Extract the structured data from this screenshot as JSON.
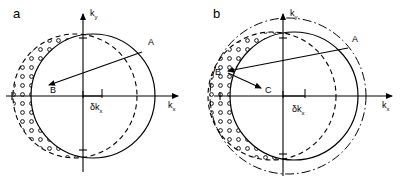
{
  "figure": {
    "type": "scientific-diagram",
    "background_color": "#ffffff",
    "line_color": "#000000",
    "width": 400,
    "height": 183
  },
  "panels": [
    {
      "id": "a",
      "label": "a",
      "label_pos": {
        "x": 13,
        "y": 18
      },
      "axes": {
        "x_label": "k",
        "x_subscript": "x",
        "y_label": "k",
        "y_subscript": "y",
        "origin": {
          "x": 83,
          "y": 96
        },
        "x_axis_from": 6,
        "x_axis_to": 178,
        "y_axis_from": 172,
        "y_axis_to": 14,
        "x_label_pos": {
          "x": 168,
          "y": 108
        },
        "y_label_pos": {
          "x": 90,
          "y": 16
        }
      },
      "circles": [
        {
          "name": "solid-fermi-sphere-displaced",
          "style": "solid",
          "cx": 93,
          "cy": 96,
          "r": 62
        },
        {
          "name": "dashed-fermi-sphere-equilibrium",
          "style": "dashed",
          "cx": 75,
          "cy": 96,
          "r": 62
        }
      ],
      "regions": [
        {
          "name": "filled-dots-region",
          "marker": "filled-circle",
          "side": "right",
          "description": "occupied states crescent (filled dots)"
        },
        {
          "name": "open-dots-region",
          "marker": "open-circle",
          "side": "left",
          "description": "emptied states crescent (open circles)"
        }
      ],
      "annotations": [
        {
          "name": "point-label-A",
          "text": "A",
          "x": 148,
          "y": 45
        },
        {
          "name": "point-label-B",
          "text": "B",
          "x": 50,
          "y": 93
        },
        {
          "name": "delta-kx-label",
          "text": "δk",
          "subscript": "x",
          "x": 90,
          "y": 110
        }
      ],
      "arrow": {
        "name": "scattering-arrow-A-to-B",
        "from": {
          "x": 142,
          "y": 52
        },
        "to": {
          "x": 49,
          "y": 85
        }
      },
      "delta_marker": {
        "name": "delta-kx-extent",
        "from_x": 83,
        "to_x": 102,
        "y": 96
      }
    },
    {
      "id": "b",
      "label": "b",
      "label_pos": {
        "x": 213,
        "y": 18
      },
      "axes": {
        "x_label": "k",
        "x_subscript": "x",
        "y_label": "k",
        "y_subscript": "y",
        "origin": {
          "x": 283,
          "y": 96
        },
        "x_axis_from": 214,
        "x_axis_to": 392,
        "y_axis_from": 176,
        "y_axis_to": 14,
        "x_label_pos": {
          "x": 382,
          "y": 108
        },
        "y_label_pos": {
          "x": 290,
          "y": 16
        }
      },
      "circles": [
        {
          "name": "dash-dot-outer-sphere",
          "style": "dash-dot",
          "cx": 288,
          "cy": 96,
          "r": 78
        },
        {
          "name": "solid-fermi-sphere-displaced",
          "style": "solid",
          "cx": 294,
          "cy": 96,
          "r": 64
        },
        {
          "name": "dashed-fermi-sphere-equilibrium",
          "style": "dashed",
          "cx": 272,
          "cy": 96,
          "r": 64
        }
      ],
      "regions": [
        {
          "name": "filled-dots-region",
          "marker": "filled-circle",
          "side": "right",
          "description": "occupied states crescent (filled dots)"
        },
        {
          "name": "open-dots-region",
          "marker": "open-circle",
          "side": "left",
          "description": "emptied states crescent (open circles)"
        }
      ],
      "annotations": [
        {
          "name": "point-label-A",
          "text": "A",
          "x": 352,
          "y": 42
        },
        {
          "name": "point-label-B",
          "text": "B",
          "x": 215,
          "y": 75
        },
        {
          "name": "point-label-C",
          "text": "C",
          "x": 265,
          "y": 93
        },
        {
          "name": "delta-kx-label",
          "text": "δk",
          "subscript": "x",
          "x": 292,
          "y": 112
        }
      ],
      "arrows": [
        {
          "name": "scattering-arrow-A-to-B",
          "from": {
            "x": 348,
            "y": 48
          },
          "to": {
            "x": 228,
            "y": 71
          }
        },
        {
          "name": "scattering-arrow-B-to-C",
          "from": {
            "x": 228,
            "y": 73
          },
          "to": {
            "x": 261,
            "y": 88
          }
        }
      ],
      "delta_marker": {
        "name": "delta-kx-extent",
        "from_x": 283,
        "to_x": 305,
        "y": 96
      }
    }
  ]
}
